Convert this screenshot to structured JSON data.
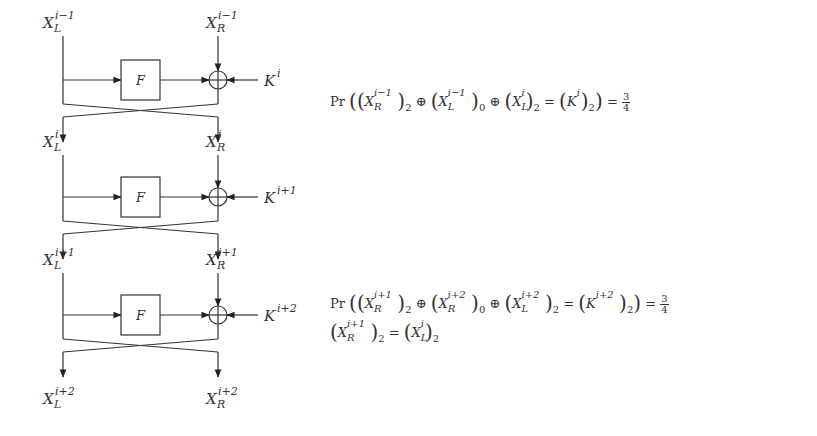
{
  "diagram": {
    "type": "feistel-network",
    "rounds": [
      {
        "in_left": {
          "base": "X",
          "sup": "i−1",
          "sub": "L"
        },
        "in_right": {
          "base": "X",
          "sup": "i−1",
          "sub": "R"
        },
        "function": "F",
        "key": {
          "base": "K",
          "sup": "i"
        }
      },
      {
        "in_left": {
          "base": "X",
          "sup": "i",
          "sub": "L"
        },
        "in_right": {
          "base": "X",
          "sup": "i",
          "sub": "R"
        },
        "function": "F",
        "key": {
          "base": "K",
          "sup": "i+1"
        }
      },
      {
        "in_left": {
          "base": "X",
          "sup": "i+1",
          "sub": "L"
        },
        "in_right": {
          "base": "X",
          "sup": "i+1",
          "sub": "R"
        },
        "function": "F",
        "key": {
          "base": "K",
          "sup": "i+2"
        }
      }
    ],
    "output": {
      "left": {
        "base": "X",
        "sup": "i+2",
        "sub": "L"
      },
      "right": {
        "base": "X",
        "sup": "i+2",
        "sub": "R"
      }
    }
  },
  "equations": {
    "eq1": {
      "pr": "Pr",
      "t1": {
        "base": "X",
        "sup": "i−1",
        "sub": "R",
        "bit": "2"
      },
      "t2": {
        "base": "X",
        "sup": "i−1",
        "sub": "L",
        "bit": "0"
      },
      "t3": {
        "base": "X",
        "sup": "i",
        "sub": "L",
        "bit": "2"
      },
      "rhs": {
        "base": "K",
        "sup": "i",
        "bit": "2"
      },
      "prob_num": "3",
      "prob_den": "4"
    },
    "eq2": {
      "pr": "Pr",
      "t1": {
        "base": "X",
        "sup": "i+1",
        "sub": "R",
        "bit": "2"
      },
      "t2": {
        "base": "X",
        "sup": "i+2",
        "sub": "R",
        "bit": "0"
      },
      "t3": {
        "base": "X",
        "sup": "i+2",
        "sub": "L",
        "bit": "2"
      },
      "rhs": {
        "base": "K",
        "sup": "i+2",
        "bit": "2"
      },
      "prob_num": "3",
      "prob_den": "4"
    },
    "eq3": {
      "lhs": {
        "base": "X",
        "sup": "i+1",
        "sub": "R",
        "bit": "2"
      },
      "rhs": {
        "base": "X",
        "sup": "i",
        "sub": "L",
        "bit": "2"
      }
    },
    "symbols": {
      "xor": "⊕",
      "eq": "=",
      "lp": "(",
      "rp": ")"
    }
  }
}
